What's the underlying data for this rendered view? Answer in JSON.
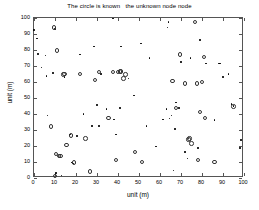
{
  "chart_data": {
    "type": "scatter",
    "title": "The circle is known   the unknown node node",
    "xlabel": "unit (m)",
    "ylabel": "unit (m)",
    "xlim": [
      0,
      100
    ],
    "ylim": [
      0,
      100
    ],
    "xticks": [
      0,
      10,
      20,
      30,
      40,
      50,
      60,
      70,
      80,
      90,
      100
    ],
    "yticks": [
      0,
      10,
      20,
      30,
      40,
      50,
      60,
      70,
      80,
      90,
      100
    ],
    "grid": false,
    "legend": "none",
    "series": [
      {
        "name": "unknown node",
        "marker": "dot",
        "color": "#000000",
        "points": [
          [
            0.5,
            92.0
          ],
          [
            2.0,
            86.5
          ],
          [
            2.5,
            77.0
          ],
          [
            4.0,
            68.5
          ],
          [
            6.0,
            76.0
          ],
          [
            6.5,
            63.0
          ],
          [
            7.0,
            38.5
          ],
          [
            9.5,
            65.0
          ],
          [
            10.5,
            92.5
          ],
          [
            11.0,
            2.5
          ],
          [
            13.5,
            1.0
          ],
          [
            15.0,
            62.5
          ],
          [
            17.5,
            26.5
          ],
          [
            18.5,
            9.0
          ],
          [
            19.0,
            8.5
          ],
          [
            21.0,
            25.5
          ],
          [
            22.5,
            76.5
          ],
          [
            24.0,
            39.5
          ],
          [
            28.0,
            32.0
          ],
          [
            29.0,
            81.5
          ],
          [
            30.5,
            45.0
          ],
          [
            31.5,
            32.0
          ],
          [
            32.5,
            64.5
          ],
          [
            35.0,
            42.5
          ],
          [
            38.0,
            99.0
          ],
          [
            38.5,
            36.0
          ],
          [
            39.5,
            26.5
          ],
          [
            41.5,
            43.0
          ],
          [
            42.0,
            81.5
          ],
          [
            45.5,
            61.5
          ],
          [
            48.0,
            51.0
          ],
          [
            51.5,
            83.5
          ],
          [
            54.0,
            32.0
          ],
          [
            55.5,
            74.5
          ],
          [
            58.5,
            19.0
          ],
          [
            62.0,
            36.0
          ],
          [
            63.5,
            42.5
          ],
          [
            64.0,
            93.5
          ],
          [
            64.5,
            97.0
          ],
          [
            65.0,
            36.5
          ],
          [
            66.0,
            38.5
          ],
          [
            67.0,
            4.0
          ],
          [
            67.5,
            30.0
          ],
          [
            68.0,
            46.5
          ],
          [
            69.5,
            43.0
          ],
          [
            70.5,
            72.0
          ],
          [
            72.5,
            15.5
          ],
          [
            73.5,
            11.5
          ],
          [
            74.0,
            24.0
          ],
          [
            75.0,
            74.5
          ],
          [
            78.5,
            18.0
          ],
          [
            79.5,
            85.5
          ],
          [
            82.5,
            71.0
          ],
          [
            86.5,
            35.5
          ],
          [
            88.5,
            71.0
          ],
          [
            89.0,
            71.0
          ],
          [
            90.5,
            62.5
          ],
          [
            93.0,
            64.5
          ],
          [
            94.5,
            45.5
          ],
          [
            95.5,
            44.5
          ],
          [
            98.5,
            18.0
          ],
          [
            99.0,
            23.0
          ]
        ]
      },
      {
        "name": "known node (anchor)",
        "marker": "circle",
        "color": "#333333",
        "points": [
          [
            8.5,
            31.5
          ],
          [
            10.0,
            93.5
          ],
          [
            10.5,
            0.5
          ],
          [
            11.0,
            14.5
          ],
          [
            11.5,
            79.0
          ],
          [
            12.5,
            13.0
          ],
          [
            13.0,
            13.0
          ],
          [
            14.5,
            64.0
          ],
          [
            15.0,
            64.5
          ],
          [
            16.0,
            20.0
          ],
          [
            18.0,
            26.0
          ],
          [
            19.5,
            9.0
          ],
          [
            22.5,
            64.5
          ],
          [
            25.0,
            24.0
          ],
          [
            27.0,
            3.5
          ],
          [
            29.5,
            60.5
          ],
          [
            31.5,
            65.5
          ],
          [
            36.0,
            37.0
          ],
          [
            38.0,
            65.5
          ],
          [
            39.5,
            10.5
          ],
          [
            40.5,
            65.5
          ],
          [
            41.5,
            66.0
          ],
          [
            42.0,
            66.0
          ],
          [
            43.0,
            61.5
          ],
          [
            44.0,
            64.0
          ],
          [
            48.5,
            15.5
          ],
          [
            52.0,
            9.5
          ],
          [
            66.5,
            60.0
          ],
          [
            68.0,
            43.0
          ],
          [
            70.0,
            76.5
          ],
          [
            72.5,
            58.5
          ],
          [
            74.0,
            23.5
          ],
          [
            74.5,
            24.0
          ],
          [
            75.5,
            21.0
          ],
          [
            77.0,
            97.0
          ],
          [
            78.0,
            58.5
          ],
          [
            78.5,
            10.5
          ],
          [
            79.5,
            40.5
          ],
          [
            80.5,
            59.5
          ],
          [
            81.5,
            75.0
          ],
          [
            82.0,
            37.0
          ],
          [
            86.5,
            9.5
          ],
          [
            95.5,
            44.0
          ]
        ]
      }
    ]
  }
}
